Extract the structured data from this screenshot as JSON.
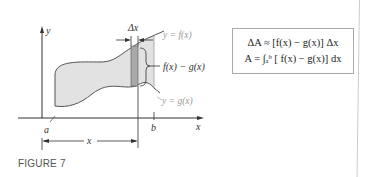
{
  "figure": {
    "caption": "FIGURE 7",
    "labels": {
      "y_axis": "y",
      "x_axis": "x",
      "a": "a",
      "b": "b",
      "x_span": "x",
      "delta_x": "Δx",
      "upper_curve": "y = f(x)",
      "lower_curve": "y = g(x)",
      "height": "f(x) − g(x)"
    },
    "colors": {
      "region_fill": "#e2e2e2",
      "strip_fill": "#a9a9a9",
      "curve_stroke": "#555555",
      "label_gray": "#999999"
    }
  },
  "formulas": {
    "line1": "ΔA ≈ [f(x) − g(x)] Δx",
    "line2": "A = ∫ₐᵇ [ f(x) − g(x)] dx"
  }
}
